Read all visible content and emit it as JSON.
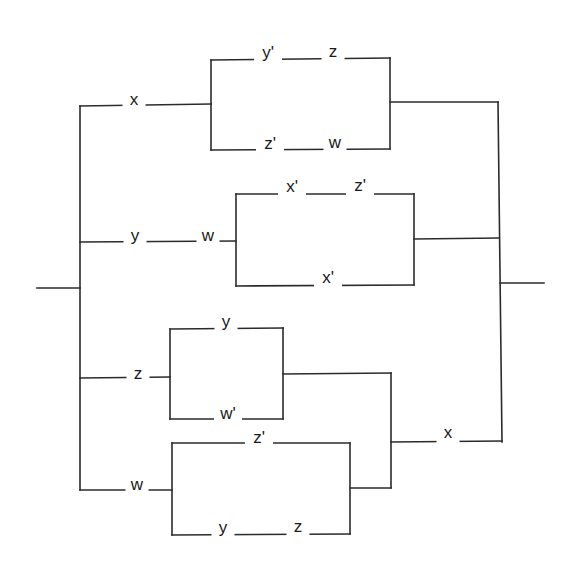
{
  "diagram": {
    "type": "switching-circuit",
    "width": 570,
    "height": 566,
    "colors": {
      "wire": "#2b2b2b",
      "label": "#1a1a1a",
      "background": "#ffffff"
    },
    "terminals": {
      "input": {
        "x1": 37,
        "y1": 288,
        "x2": 80,
        "y2": 288
      },
      "output": {
        "x1": 500,
        "y1": 283,
        "x2": 544,
        "y2": 283
      }
    },
    "wires": [
      {
        "id": "left-bus",
        "points": [
          [
            80,
            106
          ],
          [
            80,
            490
          ]
        ]
      },
      {
        "id": "right-bus",
        "points": [
          [
            498,
            102
          ],
          [
            502,
            442
          ]
        ]
      },
      {
        "id": "branch1-lead",
        "points": [
          [
            80,
            106
          ],
          [
            211,
            104
          ]
        ]
      },
      {
        "id": "box1-left",
        "points": [
          [
            211,
            60
          ],
          [
            211,
            150
          ]
        ]
      },
      {
        "id": "box1-top",
        "points": [
          [
            211,
            60
          ],
          [
            390,
            58
          ]
        ]
      },
      {
        "id": "box1-bottom",
        "points": [
          [
            211,
            150
          ],
          [
            390,
            149
          ]
        ]
      },
      {
        "id": "box1-right",
        "points": [
          [
            390,
            58
          ],
          [
            390,
            149
          ]
        ]
      },
      {
        "id": "box1-out",
        "points": [
          [
            390,
            102
          ],
          [
            498,
            102
          ]
        ]
      },
      {
        "id": "branch2-lead",
        "points": [
          [
            80,
            242
          ],
          [
            236,
            241
          ]
        ]
      },
      {
        "id": "box2-left",
        "points": [
          [
            236,
            194
          ],
          [
            236,
            286
          ]
        ]
      },
      {
        "id": "box2-top",
        "points": [
          [
            236,
            194
          ],
          [
            414,
            194
          ]
        ]
      },
      {
        "id": "box2-bottom",
        "points": [
          [
            236,
            286
          ],
          [
            414,
            285
          ]
        ]
      },
      {
        "id": "box2-right",
        "points": [
          [
            414,
            194
          ],
          [
            414,
            285
          ]
        ]
      },
      {
        "id": "box2-out",
        "points": [
          [
            414,
            239
          ],
          [
            499,
            238
          ]
        ]
      },
      {
        "id": "branch3-lead",
        "points": [
          [
            80,
            378
          ],
          [
            170,
            377
          ]
        ]
      },
      {
        "id": "box3-left",
        "points": [
          [
            170,
            329
          ],
          [
            170,
            419
          ]
        ]
      },
      {
        "id": "box3-top",
        "points": [
          [
            170,
            329
          ],
          [
            283,
            328
          ]
        ]
      },
      {
        "id": "box3-bottom",
        "points": [
          [
            170,
            419
          ],
          [
            283,
            419
          ]
        ]
      },
      {
        "id": "box3-right",
        "points": [
          [
            283,
            328
          ],
          [
            283,
            419
          ]
        ]
      },
      {
        "id": "box3-out",
        "points": [
          [
            283,
            374
          ],
          [
            391,
            373
          ]
        ]
      },
      {
        "id": "branch4-lead",
        "points": [
          [
            80,
            490
          ],
          [
            172,
            490
          ]
        ]
      },
      {
        "id": "box4-left",
        "points": [
          [
            172,
            443
          ],
          [
            172,
            535
          ]
        ]
      },
      {
        "id": "box4-top",
        "points": [
          [
            172,
            443
          ],
          [
            350,
            443
          ]
        ]
      },
      {
        "id": "box4-bottom",
        "points": [
          [
            172,
            535
          ],
          [
            350,
            534
          ]
        ]
      },
      {
        "id": "box4-right",
        "points": [
          [
            350,
            443
          ],
          [
            350,
            534
          ]
        ]
      },
      {
        "id": "box4-out",
        "points": [
          [
            350,
            488
          ],
          [
            391,
            488
          ]
        ]
      },
      {
        "id": "merge-bus",
        "points": [
          [
            391,
            373
          ],
          [
            391,
            488
          ]
        ]
      },
      {
        "id": "merge-out",
        "points": [
          [
            391,
            442
          ],
          [
            502,
            441
          ]
        ]
      }
    ],
    "switches": [
      {
        "id": "s1",
        "label": "x",
        "x": 134,
        "y": 104,
        "branch": 1
      },
      {
        "id": "s2",
        "label": "y'",
        "x": 268,
        "y": 57,
        "branch": 1
      },
      {
        "id": "s3",
        "label": "z",
        "x": 333,
        "y": 56,
        "branch": 1
      },
      {
        "id": "s4",
        "label": "z'",
        "x": 270,
        "y": 148,
        "branch": 1
      },
      {
        "id": "s5",
        "label": "w",
        "x": 335,
        "y": 147,
        "branch": 1
      },
      {
        "id": "s6",
        "label": "y",
        "x": 135,
        "y": 240,
        "branch": 2
      },
      {
        "id": "s7",
        "label": "w",
        "x": 208,
        "y": 240,
        "branch": 2
      },
      {
        "id": "s8",
        "label": "x'",
        "x": 292,
        "y": 191,
        "branch": 2
      },
      {
        "id": "s9",
        "label": "z'",
        "x": 360,
        "y": 190,
        "branch": 2
      },
      {
        "id": "s10",
        "label": "x'",
        "x": 328,
        "y": 282,
        "branch": 2
      },
      {
        "id": "s11",
        "label": "z",
        "x": 138,
        "y": 378,
        "branch": 3
      },
      {
        "id": "s12",
        "label": "y",
        "x": 226,
        "y": 326,
        "branch": 3
      },
      {
        "id": "s13",
        "label": "w'",
        "x": 228,
        "y": 418,
        "branch": 3
      },
      {
        "id": "s14",
        "label": "w",
        "x": 137,
        "y": 489,
        "branch": 4
      },
      {
        "id": "s15",
        "label": "z'",
        "x": 259,
        "y": 442,
        "branch": 4
      },
      {
        "id": "s16",
        "label": "y",
        "x": 223,
        "y": 532,
        "branch": 4
      },
      {
        "id": "s17",
        "label": "z",
        "x": 298,
        "y": 531,
        "branch": 4
      },
      {
        "id": "s18",
        "label": "x",
        "x": 448,
        "y": 437,
        "branch": 5
      }
    ]
  }
}
